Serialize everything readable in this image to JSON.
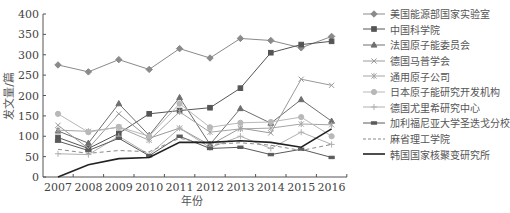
{
  "chart_data": {
    "type": "line",
    "title": "",
    "xlabel": "年份",
    "ylabel": "发文量/篇",
    "ylim": [
      0,
      400
    ],
    "yticks": [
      0,
      50,
      100,
      150,
      200,
      250,
      300,
      350,
      400
    ],
    "grid": false,
    "legend_position": "right",
    "x": [
      "2007",
      "2008",
      "2009",
      "2010",
      "2011",
      "2012",
      "2013",
      "2014",
      "2015",
      "2016"
    ],
    "series": [
      {
        "name": "美国能源部国家实验室",
        "marker": "diamond",
        "color": "#8a8a8a",
        "dash": "",
        "width": 1,
        "values": [
          275,
          258,
          288,
          264,
          315,
          292,
          340,
          335,
          317,
          345
        ]
      },
      {
        "name": "中国科学院",
        "marker": "square",
        "color": "#555555",
        "dash": "",
        "width": 1,
        "values": [
          97,
          70,
          107,
          155,
          163,
          170,
          218,
          305,
          325,
          333
        ]
      },
      {
        "name": "法国原子能委员会",
        "marker": "triangle",
        "color": "#6e6e6e",
        "dash": "",
        "width": 1,
        "values": [
          113,
          83,
          180,
          102,
          195,
          80,
          168,
          132,
          190,
          137
        ]
      },
      {
        "name": "德国马普学会",
        "marker": "x",
        "color": "#9a9a9a",
        "dash": "",
        "width": 1,
        "values": [
          127,
          70,
          155,
          95,
          120,
          78,
          120,
          108,
          240,
          225
        ]
      },
      {
        "name": "通用原子公司",
        "marker": "asterisk",
        "color": "#a5a5a5",
        "dash": "",
        "width": 1,
        "values": [
          115,
          112,
          122,
          90,
          160,
          110,
          118,
          120,
          130,
          128
        ]
      },
      {
        "name": "日本原子能研究开发机构",
        "marker": "circle",
        "color": "#b8b8b8",
        "dash": "",
        "width": 1,
        "values": [
          155,
          110,
          123,
          100,
          180,
          122,
          133,
          135,
          147,
          100
        ]
      },
      {
        "name": "德国尤里希研究中心",
        "marker": "plus",
        "color": "#b0b0b0",
        "dash": "",
        "width": 1,
        "values": [
          57,
          55,
          100,
          55,
          120,
          72,
          100,
          70,
          110,
          80
        ]
      },
      {
        "name": "加利福尼亚大学圣迭戈分校",
        "marker": "dash",
        "color": "#5a5a5a",
        "dash": "",
        "width": 1,
        "values": [
          88,
          65,
          95,
          52,
          100,
          70,
          73,
          55,
          68,
          48
        ]
      },
      {
        "name": "麻省理工学院",
        "marker": "none",
        "color": "#8a8a8a",
        "dash": "4,3",
        "width": 1,
        "values": [
          68,
          58,
          65,
          62,
          95,
          80,
          84,
          78,
          65,
          80
        ]
      },
      {
        "name": "韩国国家核聚变研究所",
        "marker": "none",
        "color": "#222222",
        "dash": "",
        "width": 1.6,
        "values": [
          0,
          30,
          45,
          48,
          85,
          85,
          89,
          85,
          73,
          118
        ]
      }
    ]
  }
}
